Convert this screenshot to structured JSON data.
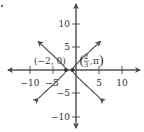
{
  "chart_data": {
    "type": "line",
    "title": "",
    "xlabel": "",
    "ylabel": "",
    "xlim": [
      -13,
      13
    ],
    "ylim": [
      -13,
      13
    ],
    "grid": false,
    "x_ticks": [
      -10,
      -5,
      5,
      10
    ],
    "y_ticks": [
      10,
      5,
      -5,
      -10
    ],
    "x_tick_labels": [
      "−10",
      "−5",
      "5",
      "10"
    ],
    "y_tick_labels": [
      "10",
      "5",
      "−5",
      "−10"
    ],
    "curve": {
      "kind": "hyperbola",
      "center": [
        -1.333,
        0
      ],
      "vertices": [
        [
          -2,
          0
        ],
        [
          -0.667,
          0
        ]
      ],
      "branches": [
        "left",
        "right"
      ],
      "arrows_at_ends": true
    },
    "points": [
      {
        "label": "(−2, 0)",
        "x": -2,
        "y": 0
      },
      {
        "label_main": "2",
        "label_den": "3",
        "label_theta": "π",
        "label": "(2/3, π)",
        "x": -0.667,
        "y": 0
      }
    ],
    "colors": {
      "curve": "#4a4a4a",
      "axes": "#4a4a4a",
      "points": "#333333"
    }
  },
  "marker": "•"
}
